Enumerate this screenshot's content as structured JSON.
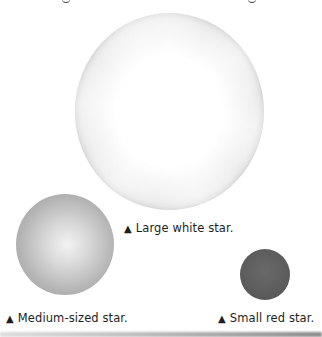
{
  "figure": {
    "stars": [
      {
        "id": "large",
        "label": "Large white star.",
        "color": "#ffffff",
        "diameter_px": 190
      },
      {
        "id": "medium",
        "label": "Medium-sized star.",
        "color": "#b4b4b4",
        "diameter_px": 99
      },
      {
        "id": "small",
        "label": "Small red star.",
        "color": "#5c5c5c",
        "diameter_px": 50
      }
    ],
    "marker_glyph": "▲"
  }
}
